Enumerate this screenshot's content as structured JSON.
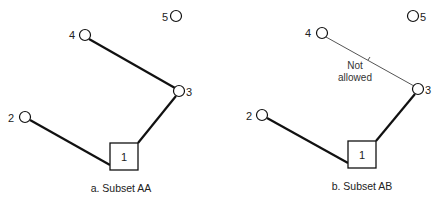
{
  "panels": [
    {
      "id": "a",
      "caption": "a. Subset AA",
      "root": {
        "label": "1",
        "x": 110,
        "y": 143,
        "w": 28,
        "h": 27
      },
      "nodes": [
        {
          "label": "2",
          "cx": 25,
          "cy": 117,
          "lx": 12,
          "ly": 122
        },
        {
          "label": "3",
          "cx": 179,
          "cy": 91,
          "lx": 186,
          "ly": 96
        },
        {
          "label": "4",
          "cx": 85,
          "cy": 35,
          "lx": 68,
          "ly": 39
        },
        {
          "label": "5",
          "cx": 176,
          "cy": 16,
          "lx": 161,
          "ly": 21
        }
      ],
      "edges": [
        {
          "from": "1",
          "to": "2",
          "allowed": true
        },
        {
          "from": "1",
          "to": "3",
          "allowed": true
        },
        {
          "from": "3",
          "to": "4",
          "allowed": true
        }
      ]
    },
    {
      "id": "b",
      "caption": "b. Subset AB",
      "root": {
        "label": "1",
        "x": 348,
        "y": 141,
        "w": 28,
        "h": 27
      },
      "nodes": [
        {
          "label": "2",
          "cx": 262,
          "cy": 115,
          "lx": 248,
          "ly": 120
        },
        {
          "label": "3",
          "cx": 418,
          "cy": 89,
          "lx": 425,
          "ly": 94
        },
        {
          "label": "4",
          "cx": 322,
          "cy": 33,
          "lx": 305,
          "ly": 37
        },
        {
          "label": "5",
          "cx": 413,
          "cy": 16,
          "lx": 420,
          "ly": 21
        }
      ],
      "edges": [
        {
          "from": "1",
          "to": "2",
          "allowed": true
        },
        {
          "from": "1",
          "to": "3",
          "allowed": true
        },
        {
          "from": "3",
          "to": "4",
          "allowed": false,
          "note_line1": "Not",
          "note_line2": "allowed"
        }
      ]
    }
  ]
}
